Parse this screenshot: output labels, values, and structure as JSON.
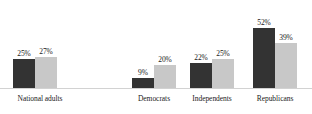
{
  "chart_data": {
    "type": "bar",
    "title": "",
    "subtitle": "",
    "xlabel": "",
    "ylabel": "",
    "ylim": [
      0,
      60
    ],
    "grid": false,
    "legend": "none",
    "orientation": "vertical",
    "grouping": "grouped",
    "value_suffix": "%",
    "categories": [
      "National adults",
      "Democrats",
      "Independents",
      "Republicans"
    ],
    "series": [
      {
        "name": "series-1",
        "color": "#333333",
        "values": [
          25,
          9,
          22,
          52
        ],
        "labels": [
          "25%",
          "9%",
          "22%",
          "52%"
        ]
      },
      {
        "name": "series-2",
        "color": "#c8c8c8",
        "values": [
          27,
          20,
          25,
          39
        ],
        "labels": [
          "27%",
          "20%",
          "25%",
          "39%"
        ]
      }
    ]
  },
  "style": {
    "background": "#ffffff",
    "axis_color": "#d2d2d2",
    "text_color": "#1a1a1a"
  },
  "layout": {
    "groups": [
      {
        "left": 13,
        "label_left": 0,
        "label_width": 80
      },
      {
        "left": 132,
        "label_left": 119,
        "label_width": 70
      },
      {
        "left": 190,
        "label_left": 177,
        "label_width": 70
      },
      {
        "left": 253,
        "label_left": 240,
        "label_width": 70
      }
    ]
  }
}
